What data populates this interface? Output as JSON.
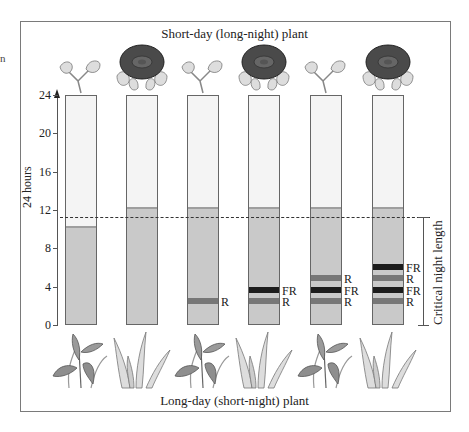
{
  "titles": {
    "top": "Short-day (long-night) plant",
    "bottom": "Long-day (short-night) plant"
  },
  "edge_fragment": "n",
  "axis": {
    "label": "24 hours",
    "ticks": [
      "24",
      "20",
      "16",
      "12",
      "8",
      "4",
      "0"
    ]
  },
  "critical_label": "Critical night length",
  "colors": {
    "day": "#f4f4f4",
    "night": "#c9c9c9",
    "red_flash": "#777777",
    "far_red_flash": "#1c1c1c",
    "flower": "#4a4a4a",
    "leaf": "#d4d4d4"
  },
  "chart_data": {
    "type": "bar",
    "ylabel": "24 hours",
    "ylim": [
      0,
      24
    ],
    "critical_night_length_hours": 11.2,
    "categories": [
      "1",
      "2",
      "3",
      "4",
      "5",
      "6"
    ],
    "series": [
      {
        "name": "Night length (h)",
        "values": [
          10,
          12,
          12,
          12,
          12,
          12
        ]
      },
      {
        "name": "Day length (h)",
        "values": [
          14,
          12,
          12,
          12,
          12,
          12
        ]
      }
    ],
    "flashes": [
      [],
      [],
      [
        "R"
      ],
      [
        "R",
        "FR"
      ],
      [
        "R",
        "FR",
        "R"
      ],
      [
        "R",
        "FR",
        "R",
        "FR"
      ]
    ],
    "short_day_plant_flowers": [
      false,
      true,
      false,
      true,
      false,
      true
    ],
    "long_day_plant_flowers": [
      true,
      false,
      true,
      false,
      true,
      false
    ]
  },
  "bars": [
    {
      "night_hours": 10,
      "flashes": [],
      "top_plant": "vegetative",
      "bottom_plant": "flowering"
    },
    {
      "night_hours": 12,
      "flashes": [],
      "top_plant": "flowering",
      "bottom_plant": "vegetative"
    },
    {
      "night_hours": 12,
      "flashes": [
        {
          "type": "R",
          "label": "R",
          "hour": 2.5
        }
      ],
      "top_plant": "vegetative",
      "bottom_plant": "flowering"
    },
    {
      "night_hours": 12,
      "flashes": [
        {
          "type": "R",
          "label": "R",
          "hour": 2.5
        },
        {
          "type": "FR",
          "label": "FR",
          "hour": 3.7
        }
      ],
      "top_plant": "flowering",
      "bottom_plant": "vegetative"
    },
    {
      "night_hours": 12,
      "flashes": [
        {
          "type": "R",
          "label": "R",
          "hour": 2.5
        },
        {
          "type": "FR",
          "label": "FR",
          "hour": 3.7
        },
        {
          "type": "R",
          "label": "R",
          "hour": 4.9
        }
      ],
      "top_plant": "vegetative",
      "bottom_plant": "flowering"
    },
    {
      "night_hours": 12,
      "flashes": [
        {
          "type": "R",
          "label": "R",
          "hour": 2.5
        },
        {
          "type": "FR",
          "label": "FR",
          "hour": 3.7
        },
        {
          "type": "R",
          "label": "R",
          "hour": 4.9
        },
        {
          "type": "FR",
          "label": "FR",
          "hour": 6.1
        }
      ],
      "top_plant": "flowering",
      "bottom_plant": "vegetative"
    }
  ]
}
